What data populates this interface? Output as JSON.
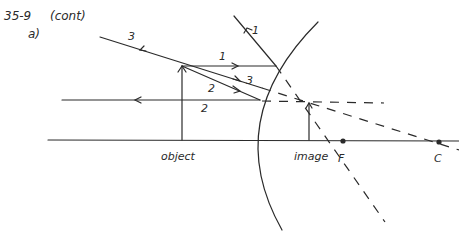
{
  "header": {
    "problem": "35-9",
    "note": "(cont)",
    "part": "a)"
  },
  "labels": {
    "object": "object",
    "image": "image",
    "focal_point": "F",
    "center_of_curvature": "C"
  },
  "rays": [
    {
      "id": "1",
      "label": "1",
      "description": "parallel to axis, reflects through F"
    },
    {
      "id": "2",
      "label": "2",
      "description": "toward F, reflects parallel to axis"
    },
    {
      "id": "3",
      "label": "3",
      "description": "toward C, reflects back on itself"
    }
  ],
  "elements": {
    "mirror": "convex mirror",
    "axis": "principal axis"
  }
}
